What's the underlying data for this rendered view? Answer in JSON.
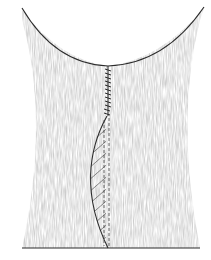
{
  "figure": {
    "type": "surgical-illustration",
    "colors": {
      "line": "#2b2b2b",
      "shading": "#bdbdbd",
      "hatch": "#555555",
      "background": "#ffffff"
    },
    "elements": {
      "defect_arc": {
        "start": [
          22,
          8
        ],
        "apex": [
          108,
          66
        ],
        "end": [
          204,
          7
        ]
      },
      "suture_line": {
        "start": [
          108,
          66
        ],
        "end": [
          107,
          116
        ],
        "stitch_count": 12
      },
      "flap_curve": {
        "start": [
          107,
          116
        ],
        "bulge": [
          86,
          175
        ],
        "end": [
          108,
          248
        ]
      },
      "dashed_midlines": [
        {
          "x": 104,
          "y1": 120,
          "y2": 246
        },
        {
          "x": 109,
          "y1": 118,
          "y2": 246
        }
      ],
      "baseline": {
        "x1": 22,
        "x2": 200,
        "y": 248
      }
    }
  }
}
